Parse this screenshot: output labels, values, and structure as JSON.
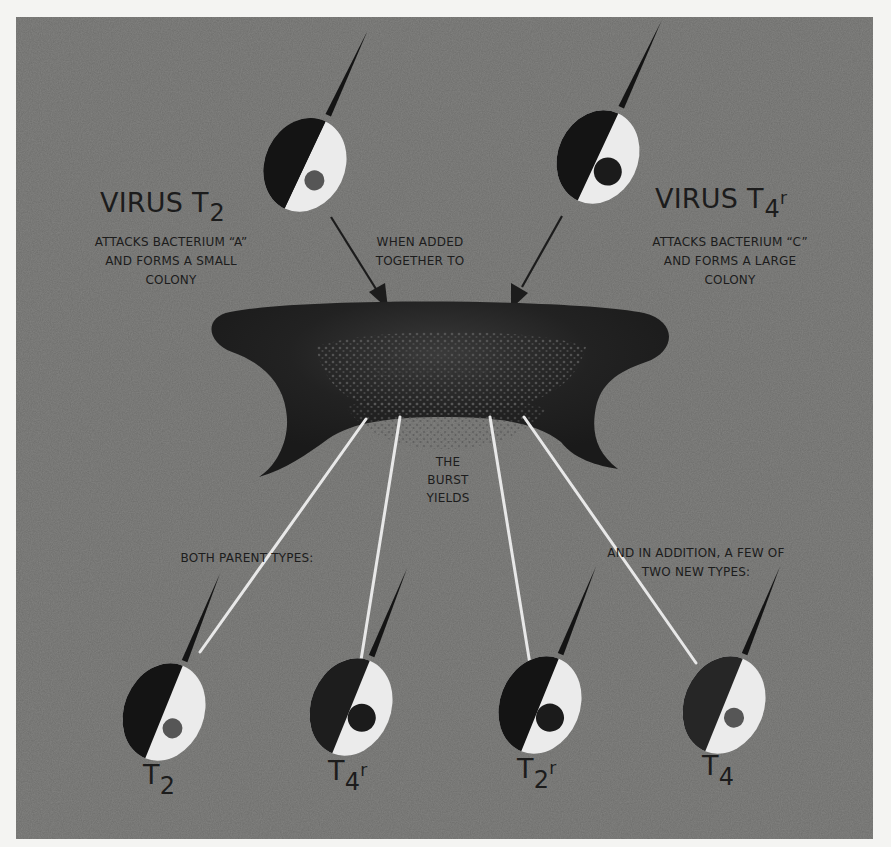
{
  "figure": {
    "colors": {
      "background": "#6d6d6b",
      "virus_dark": "#141414",
      "virus_light": "#ebebeb",
      "text": "#1c1c1c",
      "burst_lines": "#e8e8e8"
    }
  },
  "top_left_virus": {
    "title_main": "VIRUS T",
    "title_sub": "2",
    "caption_lines": [
      "ATTACKS BACTERIUM “A”",
      "AND FORMS A SMALL",
      "COLONY"
    ],
    "nucleus_size": "small"
  },
  "top_right_virus": {
    "title_main": "VIRUS T",
    "title_sub": "4",
    "title_sup": "r",
    "caption_lines": [
      "ATTACKS BACTERIUM “C”",
      "AND FORMS A LARGE",
      "COLONY"
    ],
    "nucleus_size": "large"
  },
  "center_caption": {
    "lines": [
      "WHEN ADDED",
      "TOGETHER TO"
    ]
  },
  "bacterium": {
    "label_lines": [
      "A BACTERIUM",
      "SENSITIVE TO BOTH"
    ]
  },
  "burst_caption": {
    "lines": [
      "THE",
      "BURST",
      "YIELDS"
    ]
  },
  "left_group_caption": "BOTH PARENT TYPES:",
  "right_group_caption": {
    "lines": [
      "AND IN ADDITION, A FEW OF",
      "TWO NEW TYPES:"
    ]
  },
  "offspring": [
    {
      "main": "T",
      "sub": "2",
      "sup": "",
      "nucleus_size": "small",
      "group": "parent"
    },
    {
      "main": "T",
      "sub": "4",
      "sup": "r",
      "nucleus_size": "large",
      "group": "parent"
    },
    {
      "main": "T",
      "sub": "2",
      "sup": "r",
      "nucleus_size": "large",
      "group": "new"
    },
    {
      "main": "T",
      "sub": "4",
      "sup": "",
      "nucleus_size": "small",
      "group": "new"
    }
  ]
}
